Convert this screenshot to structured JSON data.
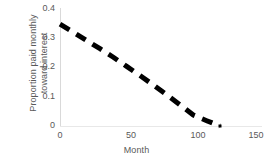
{
  "chart_data": {
    "type": "line",
    "title": "",
    "xlabel": "Month",
    "ylabel": "Proportion paid monthly toward interest",
    "xlim": [
      0,
      150
    ],
    "ylim": [
      0,
      0.4
    ],
    "xticks": [
      "0",
      "50",
      "100",
      "150"
    ],
    "xtick_values": [
      0,
      50,
      100,
      150
    ],
    "yticks": [
      "0",
      "0.1",
      "0.2",
      "0.3",
      "0.4"
    ],
    "ytick_values": [
      0,
      0.1,
      0.2,
      0.3,
      0.4
    ],
    "grid": false,
    "legend": null,
    "line_style": "dashed",
    "line_color": "#000000",
    "line_width": 5,
    "series": [
      {
        "name": "Proportion paid monthly toward interest",
        "x": [
          0,
          10,
          20,
          30,
          40,
          50,
          60,
          70,
          80,
          90,
          100,
          110,
          120
        ],
        "values": [
          0.345,
          0.318,
          0.29,
          0.262,
          0.233,
          0.202,
          0.171,
          0.139,
          0.106,
          0.072,
          0.037,
          0.018,
          0.0
        ]
      }
    ],
    "markers": [
      {
        "x": 120,
        "y": 0.0,
        "shape": "square",
        "size": 3,
        "color": "#000000"
      }
    ]
  },
  "axis": {
    "spine_color": "#d9d9d9",
    "tick_text_color": "#595959"
  }
}
